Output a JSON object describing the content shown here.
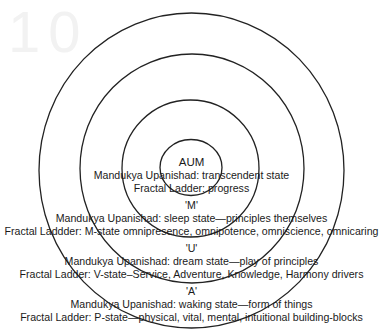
{
  "diagram": {
    "type": "concentric-circles",
    "ghost_artifact": "10",
    "rings": [
      {
        "name": "AUM",
        "cx": 191,
        "cy": 167.5,
        "rx": 31,
        "ry": 28
      },
      {
        "name": "M",
        "cx": 190.5,
        "cy": 168.5,
        "rx": 68.5,
        "ry": 68.5
      },
      {
        "name": "U",
        "cx": 192,
        "cy": 168.5,
        "rx": 112,
        "ry": 114.5
      },
      {
        "name": "A",
        "cx": 191.5,
        "cy": 170.5,
        "rx": 152.5,
        "ry": 157.5
      }
    ],
    "stroke_color": "#222222",
    "levels": [
      {
        "title": "AUM",
        "upanishad": "Mandukya Upanishad: transcendent state",
        "fractal": "Fractal Ladder: progress"
      },
      {
        "title": "'M'",
        "upanishad": "Mandukya Upanishad: sleep state—principles themselves",
        "fractal": "Fractal Laddder: M-state omnipresence, omnipotence, omniscience, omnicaring"
      },
      {
        "title": "'U'",
        "upanishad": "Mandukya Upanishad: dream state—play of principles",
        "fractal": "Fractal Ladder: V-state–Service, Adventure, Knowledge, Harmony drivers"
      },
      {
        "title": "'A'",
        "upanishad": "Mandukya Upanishad: waking state—form of things",
        "fractal": "Fractal Ladder: P-state—physical, vital, mental, intuitional building-blocks"
      }
    ]
  }
}
